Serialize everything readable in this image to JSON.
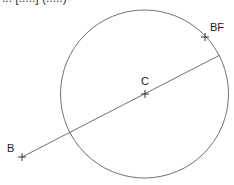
{
  "caption_clipped": "... [.....] (.....)",
  "diagram": {
    "points": [
      {
        "id": "B",
        "label": "B"
      },
      {
        "id": "C",
        "label": "C"
      },
      {
        "id": "BF",
        "label": "BF"
      }
    ],
    "elements": [
      "circle centered at C",
      "line from B through C to circle"
    ],
    "colors": {
      "stroke": "#707070",
      "marker": "#333333",
      "text": "#1a1a1a"
    }
  }
}
